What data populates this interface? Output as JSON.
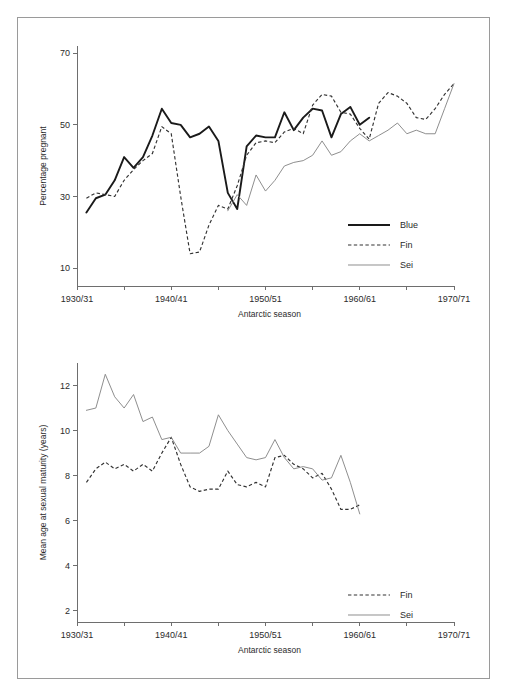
{
  "figure": {
    "background_color": "#ffffff",
    "frame_color": "#9a9a9a",
    "width": 507,
    "height": 697
  },
  "colors": {
    "blue_series": "#1a1a1a",
    "fin_series": "#333333",
    "sei_series": "#888888",
    "axis": "#6e6e6e",
    "text": "#2b2b2b"
  },
  "panels": {
    "top": {
      "name": "percentage-pregnant-panel",
      "ylabel": "Percentage pregnant",
      "xlabel": "Antarctic season",
      "ytick_labels": [
        "70",
        "50",
        "30",
        "10"
      ],
      "xtick_labels": [
        "1930/31",
        "1940/41",
        "1950/51",
        "1960/61",
        "1970/71"
      ],
      "legend": [
        {
          "label": "Blue",
          "style": "thick-solid"
        },
        {
          "label": "Fin",
          "style": "dashed"
        },
        {
          "label": "Sei",
          "style": "thin-solid"
        }
      ]
    },
    "bottom": {
      "name": "mean-age-maturity-panel",
      "ylabel": "Mean age at sexual maturity (years)",
      "xlabel": "Antarctic season",
      "ytick_labels": [
        "12",
        "10",
        "8",
        "6",
        "4",
        "2"
      ],
      "xtick_labels": [
        "1930/31",
        "1940/41",
        "1950/51",
        "1960/61",
        "1970/71"
      ],
      "legend": [
        {
          "label": "Fin",
          "style": "dashed"
        },
        {
          "label": "Sei",
          "style": "thin-solid"
        }
      ]
    }
  },
  "chart_data": [
    {
      "type": "line",
      "title": "",
      "xlabel": "Antarctic season",
      "ylabel": "Percentage pregnant",
      "xlim": [
        1930,
        1970
      ],
      "ylim": [
        5,
        72
      ],
      "yticks": [
        10,
        30,
        50,
        70
      ],
      "xticks": [
        1930,
        1935,
        1940,
        1945,
        1950,
        1955,
        1960,
        1965,
        1970
      ],
      "xtick_labels": [
        "1930/31",
        "",
        "1940/41",
        "",
        "1950/51",
        "",
        "1960/61",
        "",
        "1970/71"
      ],
      "grid": false,
      "legend_position": "lower-right",
      "series": [
        {
          "name": "Blue",
          "style": "thick-solid",
          "x": [
            1931,
            1932,
            1933,
            1934,
            1935,
            1936,
            1937,
            1938,
            1939,
            1940,
            1941,
            1942,
            1943,
            1944,
            1945,
            1946,
            1947,
            1948,
            1949,
            1950,
            1951,
            1952,
            1953,
            1954,
            1955,
            1956,
            1957,
            1958,
            1959,
            1960,
            1961
          ],
          "y": [
            25.5,
            29.5,
            30.5,
            34.5,
            41.0,
            38.0,
            41.0,
            47.0,
            54.5,
            50.5,
            50.0,
            46.5,
            47.5,
            49.5,
            45.5,
            31.0,
            26.5,
            44.0,
            47.0,
            46.5,
            46.5,
            53.5,
            48.5,
            52.0,
            54.5,
            54.0,
            46.5,
            53.0,
            55.0,
            50.0,
            52.0
          ]
        },
        {
          "name": "Fin",
          "style": "dashed",
          "x": [
            1931,
            1932,
            1933,
            1934,
            1935,
            1936,
            1937,
            1938,
            1939,
            1940,
            1941,
            1942,
            1943,
            1944,
            1945,
            1946,
            1947,
            1948,
            1949,
            1950,
            1951,
            1952,
            1953,
            1954,
            1955,
            1956,
            1957,
            1958,
            1959,
            1960,
            1961,
            1962,
            1963,
            1964,
            1965,
            1966,
            1967,
            1968,
            1969,
            1970
          ],
          "y": [
            29.5,
            31.0,
            30.5,
            30.0,
            34.5,
            37.5,
            40.0,
            42.0,
            49.5,
            47.5,
            30.0,
            14.0,
            14.5,
            22.0,
            27.5,
            26.5,
            33.0,
            41.5,
            45.0,
            45.5,
            45.0,
            48.0,
            49.0,
            47.5,
            55.5,
            58.5,
            58.0,
            53.5,
            53.0,
            49.0,
            46.0,
            56.0,
            59.0,
            58.0,
            56.0,
            52.0,
            51.5,
            54.5,
            58.5,
            61.5
          ]
        },
        {
          "name": "Sei",
          "style": "thin-solid",
          "x": [
            1946,
            1947,
            1948,
            1949,
            1950,
            1951,
            1952,
            1953,
            1954,
            1955,
            1956,
            1957,
            1958,
            1959,
            1960,
            1961,
            1962,
            1963,
            1964,
            1965,
            1966,
            1967,
            1968,
            1969,
            1970
          ],
          "y": [
            26.0,
            30.5,
            27.5,
            36.0,
            31.5,
            34.5,
            38.5,
            39.5,
            40.0,
            41.5,
            45.5,
            41.5,
            42.5,
            45.5,
            47.5,
            45.5,
            47.0,
            48.5,
            50.5,
            47.5,
            48.5,
            47.5,
            47.5,
            54.5,
            61.5
          ]
        }
      ]
    },
    {
      "type": "line",
      "title": "",
      "xlabel": "Antarctic season",
      "ylabel": "Mean age at sexual maturity (years)",
      "xlim": [
        1930,
        1970
      ],
      "ylim": [
        1.5,
        13.0
      ],
      "yticks": [
        2,
        4,
        6,
        8,
        10,
        12
      ],
      "xticks": [
        1930,
        1935,
        1940,
        1945,
        1950,
        1955,
        1960,
        1965,
        1970
      ],
      "xtick_labels": [
        "1930/31",
        "",
        "1940/41",
        "",
        "1950/51",
        "",
        "1960/61",
        "",
        "1970/71"
      ],
      "grid": false,
      "legend_position": "lower-right",
      "series": [
        {
          "name": "Fin",
          "style": "dashed",
          "x": [
            1931,
            1932,
            1933,
            1934,
            1935,
            1936,
            1937,
            1938,
            1939,
            1940,
            1941,
            1942,
            1943,
            1944,
            1945,
            1946,
            1947,
            1948,
            1949,
            1950,
            1951,
            1952,
            1953,
            1954,
            1955,
            1956,
            1957,
            1958,
            1959,
            1960
          ],
          "y": [
            7.7,
            8.3,
            8.6,
            8.3,
            8.5,
            8.2,
            8.5,
            8.2,
            9.0,
            9.7,
            8.5,
            7.5,
            7.3,
            7.4,
            7.4,
            8.2,
            7.6,
            7.5,
            7.7,
            7.5,
            8.8,
            8.9,
            8.5,
            8.3,
            7.9,
            8.1,
            7.4,
            6.5,
            6.5,
            6.7
          ]
        },
        {
          "name": "Sei",
          "style": "thin-solid",
          "x": [
            1931,
            1932,
            1933,
            1934,
            1935,
            1936,
            1937,
            1938,
            1939,
            1940,
            1941,
            1942,
            1943,
            1944,
            1945,
            1946,
            1947,
            1948,
            1949,
            1950,
            1951,
            1952,
            1953,
            1954,
            1955,
            1956,
            1957,
            1958,
            1959,
            1960
          ],
          "y": [
            10.9,
            11.0,
            12.5,
            11.5,
            11.0,
            11.6,
            10.4,
            10.6,
            9.6,
            9.7,
            9.0,
            9.0,
            9.0,
            9.3,
            10.7,
            10.0,
            9.4,
            8.8,
            8.7,
            8.8,
            9.6,
            8.8,
            8.3,
            8.4,
            8.3,
            7.8,
            7.9,
            8.9,
            7.7,
            6.3
          ]
        }
      ]
    }
  ]
}
